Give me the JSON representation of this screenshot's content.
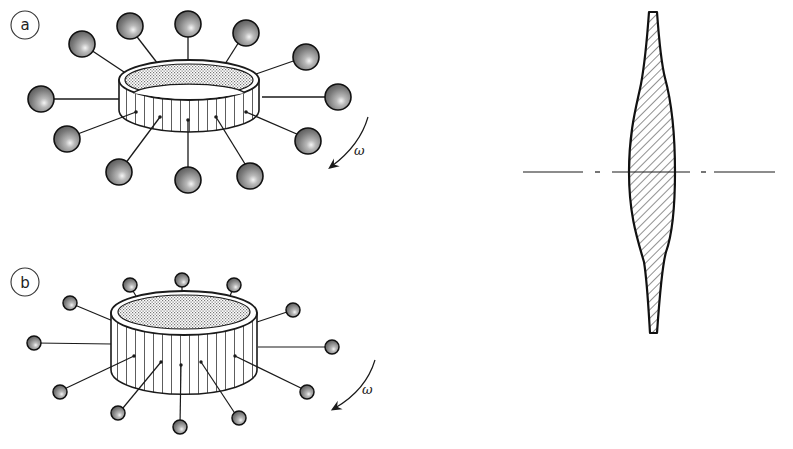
{
  "figure": {
    "panels": [
      {
        "id": "a",
        "label": "a",
        "description": "thin ring with long arms and large spheres",
        "rotation_symbol": "ω",
        "sphere_count": 13
      },
      {
        "id": "b",
        "label": "b",
        "description": "tall cylinder with shorter arms and small spheres",
        "rotation_symbol": "ω",
        "sphere_count": 13
      },
      {
        "id": "c",
        "label": "",
        "description": "hatched tapered disc cross-section with dash-dot axis line"
      }
    ]
  },
  "colors": {
    "ink": "#1a1a1a",
    "sphere_fill": "#8a8a8a",
    "sphere_highlight": "#f2f2f2",
    "stipple": "#9a9a9a",
    "background": "#ffffff"
  }
}
